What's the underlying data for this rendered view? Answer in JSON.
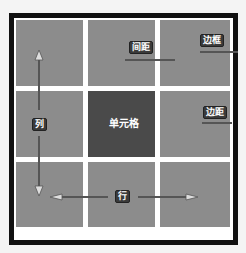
{
  "diagram": {
    "grid": {
      "rows": 3,
      "columns": 3
    },
    "labels": {
      "column": "列",
      "row": "行",
      "cell": "单元格",
      "spacing": "间距",
      "border": "边框",
      "padding": "边距"
    },
    "colors": {
      "border": "#111111",
      "cell": "#8c8c8c",
      "highlight_cell": "#4a4a4a",
      "gap": "#ffffff",
      "label_bg": "#3a3a3a",
      "label_text": "#ffffff"
    }
  }
}
